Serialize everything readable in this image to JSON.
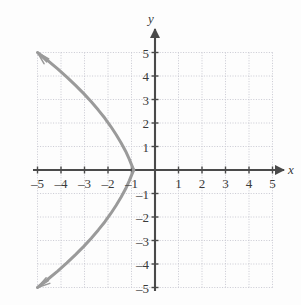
{
  "figure": {
    "background_color": "#fdfdfd",
    "axis_color": "#4a4a4a",
    "grid_color": "#c9c9d2",
    "curve_color": "#9a9a9a",
    "label_color": "#3a3a3a"
  },
  "axis_names": {
    "x": "x",
    "y": "y"
  },
  "x_tick_labels": [
    "–5",
    "–4",
    "–3",
    "–2",
    "–1",
    "1",
    "2",
    "3",
    "4",
    "5"
  ],
  "y_tick_labels": [
    "5",
    "4",
    "3",
    "2",
    "1",
    "–1",
    "–2",
    "–3",
    "–4",
    "–5"
  ],
  "chart_data": {
    "type": "line",
    "title": "",
    "subtitle": "",
    "xlabel": "x",
    "ylabel": "y",
    "xlim": [
      -5,
      5
    ],
    "ylim": [
      -5,
      5
    ],
    "grid": true,
    "grid_style": "dotted",
    "grid_step": 1,
    "legend": "none",
    "xticks": [
      -5,
      -4,
      -3,
      -2,
      -1,
      1,
      2,
      3,
      4,
      5
    ],
    "yticks": [
      5,
      4,
      3,
      2,
      1,
      -1,
      -2,
      -3,
      -4,
      -5
    ],
    "annotations": [
      {
        "text": "arrowhead",
        "x": -5,
        "y": 5
      },
      {
        "text": "arrowhead",
        "x": -5,
        "y": -5
      }
    ],
    "series": [
      {
        "name": "sideways parabola opening left",
        "equation": "x = -0.172*y^2 - 0.7",
        "vertex": [
          -0.7,
          0
        ],
        "arrow_start": [
          -5,
          5
        ],
        "arrow_end": [
          -5,
          -5
        ],
        "points": [
          [
            -5.0,
            5.0
          ],
          [
            -4.56,
            4.65
          ],
          [
            -4.14,
            4.3
          ],
          [
            -3.75,
            3.95
          ],
          [
            -3.38,
            3.6
          ],
          [
            -3.03,
            3.25
          ],
          [
            -2.71,
            2.9
          ],
          [
            -2.41,
            2.55
          ],
          [
            -2.13,
            2.2
          ],
          [
            -1.88,
            1.85
          ],
          [
            -1.65,
            1.5
          ],
          [
            -1.44,
            1.15
          ],
          [
            -1.25,
            0.8
          ],
          [
            -1.09,
            0.45
          ],
          [
            -0.95,
            0.1
          ],
          [
            -0.9,
            0.0
          ],
          [
            -0.95,
            -0.1
          ],
          [
            -1.09,
            -0.45
          ],
          [
            -1.25,
            -0.8
          ],
          [
            -1.44,
            -1.15
          ],
          [
            -1.65,
            -1.5
          ],
          [
            -1.88,
            -1.85
          ],
          [
            -2.13,
            -2.2
          ],
          [
            -2.41,
            -2.55
          ],
          [
            -2.71,
            -2.9
          ],
          [
            -3.03,
            -3.25
          ],
          [
            -3.38,
            -3.6
          ],
          [
            -3.75,
            -3.95
          ],
          [
            -4.14,
            -4.3
          ],
          [
            -4.56,
            -4.65
          ],
          [
            -5.0,
            -5.0
          ]
        ]
      }
    ]
  },
  "geometry": {
    "origin_px": [
      155,
      170
    ],
    "unit_px": 23.5
  }
}
